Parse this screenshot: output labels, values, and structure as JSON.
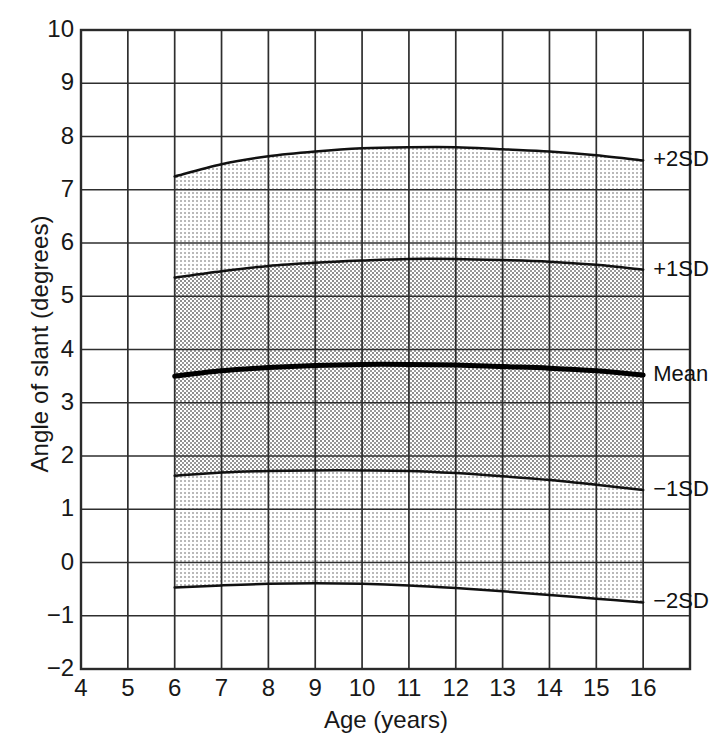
{
  "chart_data": {
    "type": "line",
    "title": "",
    "xlabel": "Age (years)",
    "ylabel": "Angle of slant (degrees)",
    "xlim": [
      4,
      17
    ],
    "ylim": [
      -2,
      10
    ],
    "xticks": [
      4,
      5,
      6,
      7,
      8,
      9,
      10,
      11,
      12,
      13,
      14,
      15,
      16
    ],
    "yticks": [
      -2,
      -1,
      0,
      1,
      2,
      3,
      4,
      5,
      6,
      7,
      8,
      9,
      10
    ],
    "grid": true,
    "legend_position": "right-inline-end-of-curve",
    "x": [
      6,
      7,
      8,
      9,
      10,
      11,
      12,
      13,
      14,
      15,
      16
    ],
    "series": [
      {
        "name": "+2SD",
        "label": "+2SD",
        "values": [
          7.25,
          7.48,
          7.63,
          7.72,
          7.78,
          7.8,
          7.8,
          7.76,
          7.72,
          7.65,
          7.55
        ]
      },
      {
        "name": "+1SD",
        "label": "+1SD",
        "values": [
          5.35,
          5.47,
          5.57,
          5.63,
          5.67,
          5.7,
          5.7,
          5.68,
          5.65,
          5.59,
          5.5
        ]
      },
      {
        "name": "Mean",
        "label": "Mean",
        "values": [
          3.5,
          3.6,
          3.66,
          3.7,
          3.72,
          3.72,
          3.71,
          3.68,
          3.65,
          3.6,
          3.52
        ]
      },
      {
        "name": "-1SD",
        "label": "−1SD",
        "values": [
          1.63,
          1.69,
          1.72,
          1.73,
          1.73,
          1.72,
          1.68,
          1.62,
          1.55,
          1.46,
          1.36
        ]
      },
      {
        "name": "-2SD",
        "label": "−2SD",
        "values": [
          -0.47,
          -0.43,
          -0.4,
          -0.39,
          -0.4,
          -0.43,
          -0.48,
          -0.54,
          -0.61,
          -0.68,
          -0.75
        ]
      }
    ],
    "bands": [
      {
        "name": "outer-upper-band",
        "upper": "+2SD",
        "lower": "+1SD",
        "shade": "light"
      },
      {
        "name": "inner-band",
        "upper": "+1SD",
        "lower": "-1SD",
        "shade": "dark"
      },
      {
        "name": "outer-lower-band",
        "upper": "-1SD",
        "lower": "-2SD",
        "shade": "light"
      }
    ],
    "colors": {
      "axis": "#2a2a2a",
      "grid": "#2e2e2e",
      "curve": "#111111",
      "mean_curve": "#000000",
      "band_light": "#e6e6e6",
      "band_dark": "#cfcfcf",
      "background": "#ffffff"
    }
  }
}
